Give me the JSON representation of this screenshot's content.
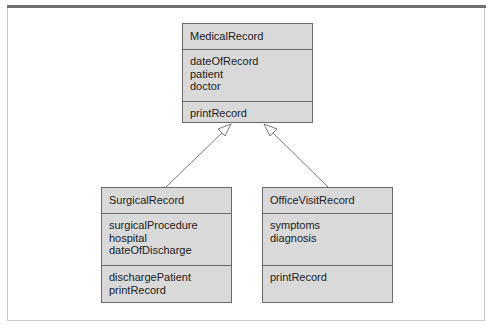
{
  "diagram": {
    "type": "UML class diagram",
    "classes": [
      {
        "name": "MedicalRecord",
        "attributes": [
          "dateOfRecord",
          "patient",
          "doctor"
        ],
        "operations": [
          "printRecord"
        ]
      },
      {
        "name": "SurgicalRecord",
        "attributes": [
          "surgicalProcedure",
          "hospital",
          "dateOfDischarge"
        ],
        "operations": [
          "dischargePatient",
          "printRecord"
        ]
      },
      {
        "name": "OfficeVisitRecord",
        "attributes": [
          "symptoms",
          "diagnosis"
        ],
        "operations": [
          "printRecord"
        ]
      }
    ],
    "relationships": [
      {
        "type": "generalization",
        "from": "SurgicalRecord",
        "to": "MedicalRecord"
      },
      {
        "type": "generalization",
        "from": "OfficeVisitRecord",
        "to": "MedicalRecord"
      }
    ],
    "colors": {
      "box_fill": "#d9d9d9",
      "box_border": "#6a6a6a",
      "frame_top": "#707070",
      "arrow": "#777777"
    }
  }
}
